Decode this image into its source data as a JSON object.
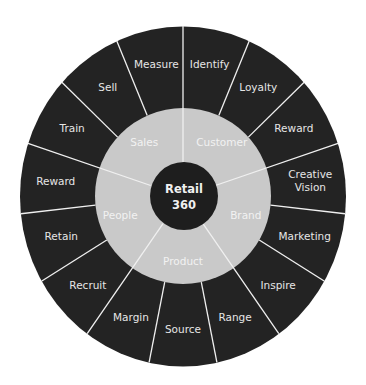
{
  "diagram": {
    "type": "radial-wheel",
    "center": {
      "label_line1": "Retail",
      "label_line2": "360"
    },
    "colors": {
      "outer_ring": "#232323",
      "inner_ring": "#c9c9c9",
      "center_circle": "#1e1e1e",
      "dividers": "#f0f0f0",
      "outer_text": "#e6e6e6",
      "inner_text": "#f4f4f4"
    },
    "categories": [
      {
        "label": "Customer",
        "segments": [
          "Identify",
          "Loyalty",
          "Reward"
        ]
      },
      {
        "label": "Brand",
        "segments": [
          "Creative Vision",
          "Marketing",
          "Inspire"
        ]
      },
      {
        "label": "Product",
        "segments": [
          "Range",
          "Source",
          "Margin"
        ]
      },
      {
        "label": "People",
        "segments": [
          "Recruit",
          "Retain",
          "Reward"
        ]
      },
      {
        "label": "Sales",
        "segments": [
          "Train",
          "Sell",
          "Measure"
        ]
      }
    ]
  }
}
